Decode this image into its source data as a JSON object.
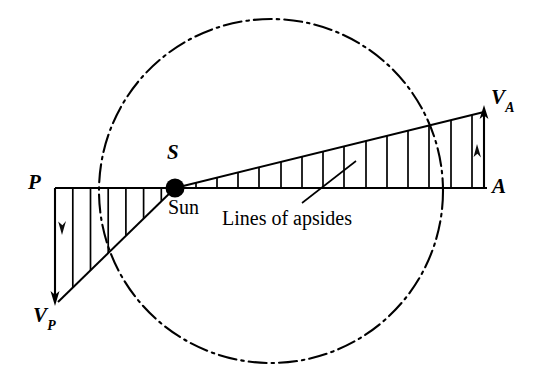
{
  "figure": {
    "background_color": "#ffffff",
    "stroke_color": "#000000",
    "width": 533,
    "height": 386
  },
  "labels": {
    "perihelion_point": "P",
    "aphelion_point": "A",
    "sun_point": "S",
    "sun_word": "Sun",
    "velocity_aphelion": "V",
    "velocity_aphelion_sub": "A",
    "velocity_perihelion": "V",
    "velocity_perihelion_sub": "P",
    "apsides_caption": "Lines of apsides"
  },
  "geometry": {
    "orbit_circle": {
      "cx": 271,
      "cy": 191,
      "r": 172,
      "style": "dash-dot"
    },
    "apsides_line": {
      "x1": 55,
      "y1": 188,
      "x2": 487,
      "y2": 188
    },
    "sun": {
      "cx": 175,
      "cy": 188,
      "r": 9
    },
    "right_triangle": {
      "apex": [
        175,
        188
      ],
      "top_right": [
        484,
        112
      ],
      "bottom_right": [
        484,
        188
      ],
      "hatch_count": 14
    },
    "left_triangle": {
      "apex": [
        175,
        188
      ],
      "top_left": [
        55,
        188
      ],
      "bottom_left": [
        58,
        302
      ],
      "hatch_count": 6
    },
    "arrow_va": {
      "x": 484,
      "y1": 188,
      "y2": 108,
      "direction": "up"
    },
    "arrow_vp": {
      "x": 55,
      "y1": 188,
      "y2": 305,
      "direction": "down"
    },
    "leader_line": {
      "x1": 302,
      "y1": 205,
      "x2": 355,
      "y2": 163
    }
  }
}
